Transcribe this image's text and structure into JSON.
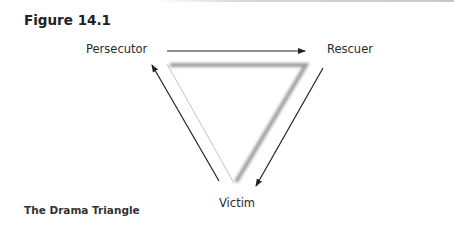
{
  "figure": {
    "title": "Figure 14.1",
    "caption": "The Drama Triangle"
  },
  "nodes": {
    "persecutor": "Persecutor",
    "rescuer": "Rescuer",
    "victim": "Victim"
  },
  "arrows": [
    {
      "from": "Persecutor",
      "to": "Rescuer"
    },
    {
      "from": "Rescuer",
      "to": "Victim"
    },
    {
      "from": "Victim",
      "to": "Persecutor"
    }
  ],
  "colors": {
    "arrow": "#222222",
    "triangle_shadow": "#9a9a9a",
    "triangle_edge": "#c4c4c4",
    "text": "#2a2a2a"
  }
}
